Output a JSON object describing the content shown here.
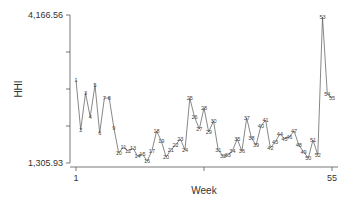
{
  "chart_data": {
    "type": "line",
    "title": "",
    "xlabel": "Week",
    "ylabel": "HHI",
    "xlim": [
      1,
      55
    ],
    "ylim": [
      1305.93,
      4166.56
    ],
    "x_tick_labels": [
      "1",
      "55"
    ],
    "y_tick_labels": [
      "1,305.93",
      "4,166.56"
    ],
    "grid": false,
    "legend": null,
    "marker_labels": "week number shown at each point",
    "x": [
      1,
      2,
      3,
      4,
      5,
      6,
      7,
      8,
      9,
      10,
      11,
      12,
      13,
      14,
      15,
      16,
      17,
      18,
      19,
      20,
      21,
      22,
      23,
      24,
      25,
      26,
      27,
      28,
      29,
      30,
      31,
      32,
      33,
      34,
      35,
      36,
      37,
      38,
      39,
      40,
      41,
      42,
      43,
      44,
      45,
      46,
      47,
      48,
      49,
      50,
      51,
      52,
      53,
      54,
      55
    ],
    "series": [
      {
        "name": "HHI",
        "values": [
          2910,
          1944,
          2659,
          2195,
          2814,
          1886,
          2562,
          2562,
          1982,
          1499,
          1615,
          1538,
          1596,
          1441,
          1480,
          1345,
          1538,
          1924,
          1731,
          1422,
          1557,
          1654,
          1770,
          1557,
          2562,
          2195,
          1963,
          2369,
          1905,
          2118,
          1557,
          1441,
          1461,
          1538,
          1770,
          1538,
          2176,
          1789,
          1654,
          2021,
          2137,
          1596,
          1712,
          1866,
          1770,
          1808,
          1924,
          1654,
          1519,
          1403,
          1750,
          1461,
          4128,
          2640,
          2562
        ]
      }
    ]
  },
  "labels": {
    "y_max": "4,166.56",
    "y_min": "1,305.93",
    "x_min": "1",
    "x_max": "55",
    "x_title": "Week",
    "y_title": "HHI"
  },
  "colors": {
    "line": "#555555",
    "axis": "#555555",
    "text": "#333333"
  }
}
